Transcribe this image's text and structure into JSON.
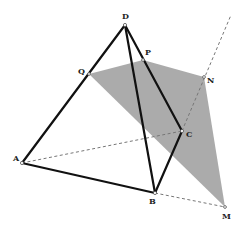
{
  "figure": {
    "colors": {
      "edge": "#111111",
      "hidden_edge": "#777777",
      "section_fill": "#a6a6a6"
    },
    "points": {
      "A": {
        "label": "A"
      },
      "B": {
        "label": "B"
      },
      "C": {
        "label": "C"
      },
      "D": {
        "label": "D"
      },
      "P": {
        "label": "P"
      },
      "Q": {
        "label": "Q"
      },
      "N": {
        "label": "N"
      },
      "M": {
        "label": "M"
      }
    },
    "solid_edges": [
      [
        "A",
        "D"
      ],
      [
        "D",
        "B"
      ],
      [
        "D",
        "C"
      ],
      [
        "A",
        "B"
      ],
      [
        "B",
        "C"
      ]
    ],
    "dashed_edges": [
      [
        "A",
        "C"
      ],
      [
        "B",
        "M"
      ],
      [
        "C",
        "N"
      ]
    ],
    "section_polygon": [
      "Q",
      "P",
      "N",
      "M"
    ]
  }
}
